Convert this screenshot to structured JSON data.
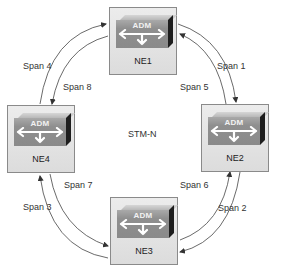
{
  "diagram": {
    "center_label": "STM-N",
    "nodes": [
      {
        "id": "NE1",
        "label": "NE1",
        "device": "ADM",
        "position": "top"
      },
      {
        "id": "NE2",
        "label": "NE2",
        "device": "ADM",
        "position": "right"
      },
      {
        "id": "NE3",
        "label": "NE3",
        "device": "ADM",
        "position": "bottom"
      },
      {
        "id": "NE4",
        "label": "NE4",
        "device": "ADM",
        "position": "left"
      }
    ],
    "spans": [
      {
        "label": "Span 1",
        "from": "NE1",
        "to": "NE2",
        "ring": "outer"
      },
      {
        "label": "Span 2",
        "from": "NE2",
        "to": "NE3",
        "ring": "outer"
      },
      {
        "label": "Span 3",
        "from": "NE3",
        "to": "NE4",
        "ring": "outer"
      },
      {
        "label": "Span 4",
        "from": "NE4",
        "to": "NE1",
        "ring": "outer"
      },
      {
        "label": "Span 5",
        "from": "NE2",
        "to": "NE1",
        "ring": "inner"
      },
      {
        "label": "Span 6",
        "from": "NE3",
        "to": "NE2",
        "ring": "inner"
      },
      {
        "label": "Span 7",
        "from": "NE4",
        "to": "NE3",
        "ring": "inner"
      },
      {
        "label": "Span 8",
        "from": "NE1",
        "to": "NE4",
        "ring": "inner"
      }
    ]
  },
  "colors": {
    "box_border": "#8a8a8a",
    "adm_face": "#8f8f8f",
    "adm_side": "#1e1e1e",
    "line": "#333333"
  }
}
